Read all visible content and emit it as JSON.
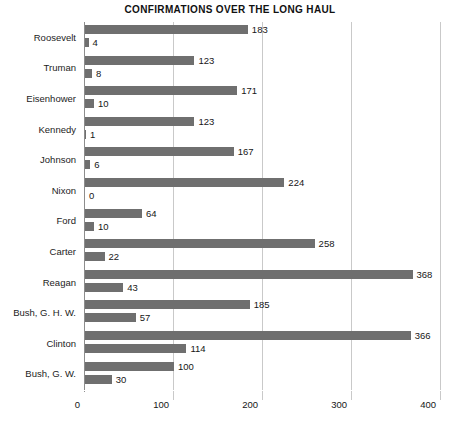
{
  "chart_data": {
    "type": "bar",
    "orientation": "horizontal",
    "title": "CONFIRMATIONS OVER THE LONG HAUL",
    "xlabel": "",
    "ylabel": "",
    "xlim": [
      0,
      400
    ],
    "xticks": [
      0,
      100,
      200,
      300,
      400
    ],
    "xtick_labels": [
      "0",
      "100",
      "200",
      "300",
      "400"
    ],
    "grid": "vertical",
    "legend": "none",
    "bar_color": "#6f6f6f",
    "gridline_color": "#c9c9c9",
    "axis_color": "#8d8d8d",
    "categories": [
      "Roosevelt",
      "Truman",
      "Eisenhower",
      "Kennedy",
      "Johnson",
      "Nixon",
      "Ford",
      "Carter",
      "Reagan",
      "Bush, G. H. W.",
      "Clinton",
      "Bush, G. W."
    ],
    "series": [
      {
        "name": "series-1",
        "values": [
          183,
          123,
          171,
          123,
          167,
          224,
          64,
          258,
          368,
          185,
          366,
          100
        ]
      },
      {
        "name": "series-2",
        "values": [
          4,
          8,
          10,
          1,
          6,
          0,
          10,
          22,
          43,
          57,
          114,
          30
        ]
      }
    ],
    "value_labels": [
      {
        "category": "Roosevelt",
        "first": "183",
        "second": "4"
      },
      {
        "category": "Truman",
        "first": "123",
        "second": "8"
      },
      {
        "category": "Eisenhower",
        "first": "171",
        "second": "10"
      },
      {
        "category": "Kennedy",
        "first": "123",
        "second": "1"
      },
      {
        "category": "Johnson",
        "first": "167",
        "second": "6"
      },
      {
        "category": "Nixon",
        "first": "224",
        "second": "0"
      },
      {
        "category": "Ford",
        "first": "64",
        "second": "10"
      },
      {
        "category": "Carter",
        "first": "258",
        "second": "22"
      },
      {
        "category": "Reagan",
        "first": "368",
        "second": "43"
      },
      {
        "category": "Bush, G. H. W.",
        "first": "185",
        "second": "57"
      },
      {
        "category": "Clinton",
        "first": "366",
        "second": "114"
      },
      {
        "category": "Bush, G. W.",
        "first": "100",
        "second": "30"
      }
    ]
  }
}
